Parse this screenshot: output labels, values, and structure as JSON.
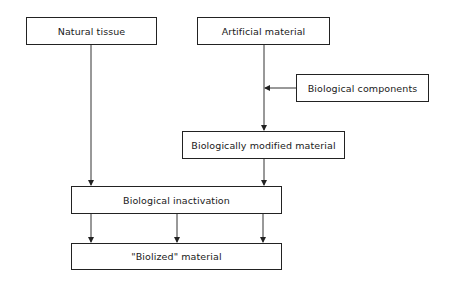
{
  "diagram": {
    "nodes": [
      {
        "id": "natural",
        "label": "Natural tissue"
      },
      {
        "id": "artificial",
        "label": "Artificial material"
      },
      {
        "id": "components",
        "label": "Biological components"
      },
      {
        "id": "modified",
        "label": "Biologically modified material"
      },
      {
        "id": "inactivation",
        "label": "Biological inactivation"
      },
      {
        "id": "biolized",
        "label": "\"Biolized\" material"
      }
    ],
    "edges": [
      {
        "from": "natural",
        "to": "inactivation"
      },
      {
        "from": "artificial",
        "to": "modified"
      },
      {
        "from": "components",
        "to": "artificial-modified-edge"
      },
      {
        "from": "modified",
        "to": "inactivation"
      },
      {
        "from": "inactivation",
        "to": "biolized",
        "count": 3
      }
    ]
  }
}
